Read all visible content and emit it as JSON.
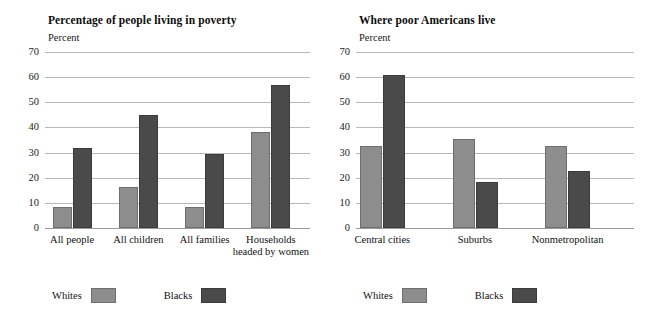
{
  "chart_data": [
    {
      "type": "bar",
      "title": "Percentage of people living in poverty",
      "ylabel": "Percent",
      "xlabel": "",
      "categories": [
        "All people",
        "All children",
        "All families",
        "Households headed by women"
      ],
      "category_lines": [
        [
          "All people"
        ],
        [
          "All children"
        ],
        [
          "All families"
        ],
        [
          "Households",
          "headed by women"
        ]
      ],
      "series": [
        {
          "name": "Whites",
          "color": "#8d8d8d",
          "values": [
            8.2,
            16.3,
            8.2,
            38.3
          ]
        },
        {
          "name": "Blacks",
          "color": "#4a4a4a",
          "values": [
            31.7,
            45.1,
            29.6,
            57.0
          ]
        }
      ],
      "ylim": [
        0,
        70
      ],
      "yticks": [
        70,
        60,
        50,
        40,
        30,
        20,
        10,
        0
      ],
      "grid": true,
      "legend_position": "bottom-left"
    },
    {
      "type": "bar",
      "title": "Where poor Americans live",
      "ylabel": "Percent",
      "xlabel": "",
      "categories": [
        "Central cities",
        "Suburbs",
        "Nonmetropolitan"
      ],
      "category_lines": [
        [
          "Central cities"
        ],
        [
          "Suburbs"
        ],
        [
          "Nonmetropolitan"
        ]
      ],
      "series": [
        {
          "name": "Whites",
          "color": "#8d8d8d",
          "values": [
            32.6,
            35.5,
            32.5
          ]
        },
        {
          "name": "Blacks",
          "color": "#4a4a4a",
          "values": [
            60.8,
            18.4,
            22.8
          ]
        }
      ],
      "ylim": [
        0,
        70
      ],
      "yticks": [
        70,
        60,
        50,
        40,
        30,
        20,
        10,
        0
      ],
      "grid": true,
      "legend_position": "bottom-left"
    }
  ],
  "panels": [
    {
      "title": "Percentage of people living in poverty",
      "unit": "Percent",
      "legend": {
        "whites_label": "Whites",
        "blacks_label": "Blacks"
      }
    },
    {
      "title": "Where poor Americans live",
      "unit": "Percent",
      "legend": {
        "whites_label": "Whites",
        "blacks_label": "Blacks"
      }
    }
  ]
}
